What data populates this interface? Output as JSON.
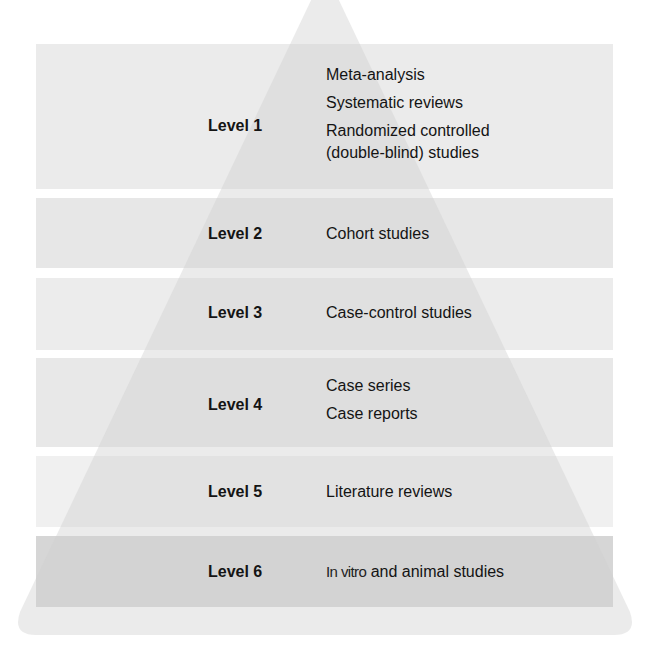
{
  "diagram": {
    "colors": {
      "background": "#ffffff",
      "band_light": "#ebebeb",
      "band_mid": "#e6e6e6",
      "band_lightest": "#efefef",
      "band_dark": "#d3d3d3",
      "pyramid_overlay": "#d8d8d8",
      "text": "#141414"
    },
    "levels": [
      {
        "label": "Level 1",
        "items": [
          "Meta-analysis",
          "Systematic reviews",
          "Randomized controlled",
          "(double-blind) studies"
        ]
      },
      {
        "label": "Level 2",
        "items": [
          "Cohort studies"
        ]
      },
      {
        "label": "Level 3",
        "items": [
          "Case-control studies"
        ]
      },
      {
        "label": "Level 4",
        "items": [
          "Case series",
          "Case reports"
        ]
      },
      {
        "label": "Level 5",
        "items": [
          "Literature reviews"
        ]
      },
      {
        "label": "Level 6",
        "items_prefix": "In vitro",
        "items_suffix": " and animal studies"
      }
    ]
  }
}
